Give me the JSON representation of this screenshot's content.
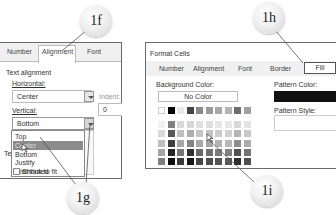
{
  "left_dialog": {
    "tabs": [
      {
        "label": "Number",
        "selected": false
      },
      {
        "label": "Alignment",
        "selected": true
      },
      {
        "label": "Font",
        "selected": false
      }
    ],
    "section_title": "Text alignment",
    "horizontal_label": "Horizontal:",
    "horizontal_value": "Center",
    "indent_label": "Indent:",
    "indent_value": "0",
    "vertical_label": "Vertical:",
    "vertical_value": "Bottom",
    "vertical_options": [
      {
        "label": "Top",
        "highlighted": false
      },
      {
        "label": "Center",
        "highlighted": true
      },
      {
        "label": "Bottom",
        "highlighted": false
      },
      {
        "label": "Justify",
        "highlighted": false
      },
      {
        "label": "Distributed",
        "highlighted": false
      }
    ],
    "text_control_partial": "Te",
    "shrink_to_fit_label": "Shrink to fit"
  },
  "right_dialog": {
    "title": "Format Cells",
    "tabs": [
      {
        "label": "Number",
        "selected": false
      },
      {
        "label": "Alignment",
        "selected": false
      },
      {
        "label": "Font",
        "selected": false
      },
      {
        "label": "Border",
        "selected": false
      },
      {
        "label": "Fill",
        "selected": true
      }
    ],
    "background_color_label": "Background Color:",
    "no_color_label": "No Color",
    "pattern_color_label": "Pattern Color:",
    "pattern_color_value": "#111111",
    "pattern_style_label": "Pattern Style:",
    "palette_top_row": [
      "#ffffff",
      "#000000",
      "#e8e8e8",
      "#444444",
      "#8a8a8a",
      "#9a9a9a",
      "#a8a8a8",
      "#b4b4b4",
      "#6e6e6e",
      "#a0a0a0"
    ],
    "palette_rows": [
      [
        "#f2f2f2",
        "#7f7f7f",
        "#d9d9d9",
        "#d6d6d6",
        "#e0e0e0",
        "#dedede",
        "#e6e6e6",
        "#e8e8e8",
        "#d8d8d8",
        "#e4e4e4"
      ],
      [
        "#d9d9d9",
        "#595959",
        "#bfbfbf",
        "#adadad",
        "#c4c4c4",
        "#c2c2c2",
        "#cccccc",
        "#d0d0d0",
        "#b4b4b4",
        "#c8c8c8"
      ],
      [
        "#bfbfbf",
        "#3f3f3f",
        "#a6a6a6",
        "#858585",
        "#a8a8a8",
        "#a4a4a4",
        "#b2b2b2",
        "#b8b8b8",
        "#8e8e8e",
        "#acacac"
      ],
      [
        "#a6a6a6",
        "#262626",
        "#767676",
        "#323232",
        "#6a6a6a",
        "#707070",
        "#7c7c7c",
        "#808080",
        "#505050",
        "#747474"
      ],
      [
        "#7f7f7f",
        "#0d0d0d",
        "#3b3b3b",
        "#161616",
        "#464646",
        "#4c4c4c",
        "#545454",
        "#585858",
        "#2e2e2e",
        "#4e4e4e"
      ]
    ]
  },
  "callouts": [
    {
      "label": "1f"
    },
    {
      "label": "1g"
    },
    {
      "label": "1h"
    },
    {
      "label": "1i"
    }
  ]
}
